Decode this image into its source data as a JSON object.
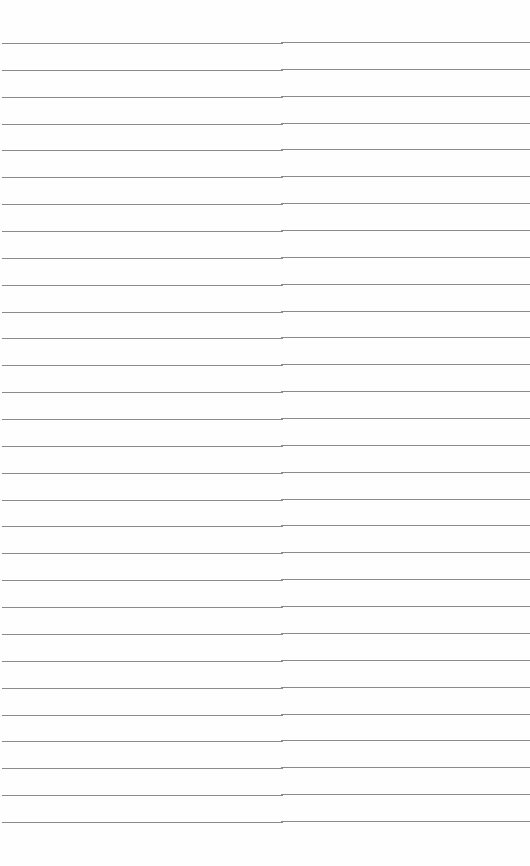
{
  "sheet": {
    "type": "lined-paper",
    "background": "#fefefe",
    "line_color": "#8a8a8a",
    "line_count": 30,
    "first_line_y": 42,
    "line_spacing": 26.86,
    "text": ""
  }
}
